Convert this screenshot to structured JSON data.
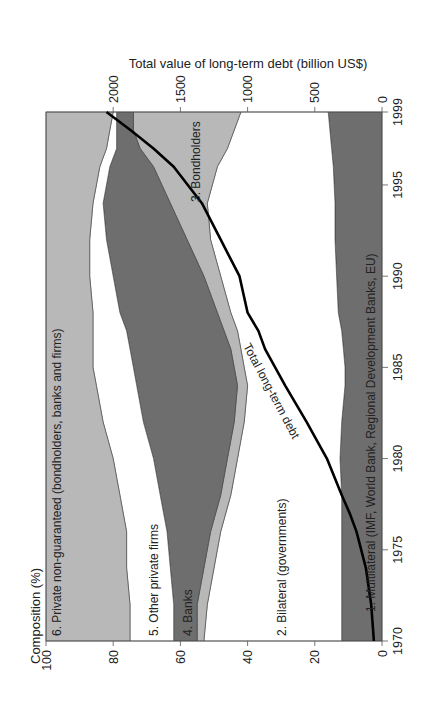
{
  "chart_data": {
    "type": "area",
    "orientation": "rotated-90 (years along vertical axis, 1970 at bottom, 1999 at top; composition % along horizontal axis, 0 at right, 100 at left)",
    "title": "",
    "xlabel": "Composition (%)",
    "secondary_axis_label": "Total value of long-term debt (billion US$)",
    "years": [
      1970,
      1972,
      1974,
      1976,
      1978,
      1980,
      1982,
      1984,
      1985,
      1986,
      1987,
      1988,
      1990,
      1992,
      1994,
      1996,
      1997,
      1998,
      1999
    ],
    "composition_ticks": [
      0,
      20,
      40,
      60,
      80,
      100
    ],
    "year_ticks": [
      1970,
      1975,
      1980,
      1985,
      1990,
      1995,
      1999
    ],
    "debt_ticks": [
      0,
      500,
      1000,
      1500,
      2000
    ],
    "composition_range": [
      0,
      100
    ],
    "debt_range": [
      0,
      2500
    ],
    "cumulative_boundaries_pct": {
      "multilateral_top": [
        12,
        12,
        12,
        12,
        12,
        12.5,
        12,
        11,
        11,
        11.5,
        12,
        13,
        13.5,
        14,
        14,
        14.5,
        15,
        15.5,
        16
      ],
      "bilateral_top": [
        53,
        52,
        50,
        48,
        45,
        43,
        41,
        40,
        41,
        42,
        43,
        45,
        48,
        51,
        52,
        49,
        46,
        44,
        42
      ],
      "bondholders_top": [
        55,
        55,
        53,
        51,
        48,
        46,
        44,
        43,
        44,
        45,
        47,
        49,
        53,
        58,
        63,
        68,
        72,
        74,
        74
      ],
      "banks_top": [
        62,
        62,
        63,
        64,
        66,
        68,
        71,
        73,
        74,
        75,
        76,
        78,
        80,
        82,
        83,
        81,
        79,
        79,
        79
      ],
      "other_private_top": [
        75,
        75,
        76,
        76,
        78,
        80,
        83,
        85,
        86,
        86,
        86,
        86,
        87,
        87,
        86,
        84,
        82,
        81,
        80
      ],
      "private_nonguaranteed_top": [
        100,
        100,
        100,
        100,
        100,
        100,
        100,
        100,
        100,
        100,
        100,
        100,
        100,
        100,
        100,
        100,
        100,
        100,
        100
      ]
    },
    "series": [
      {
        "name": "1. Multilateral (IMF, World Bank, Regional Development Banks, EU)",
        "color": "#6e6e6e",
        "values": [
          12,
          12,
          12,
          12,
          12,
          12.5,
          12,
          11,
          11,
          11.5,
          12,
          13,
          13.5,
          14,
          14,
          14.5,
          15,
          15.5,
          16
        ]
      },
      {
        "name": "2. Bilateral (governments)",
        "color": "#ffffff",
        "values": [
          41,
          40,
          38,
          36,
          33,
          30.5,
          29,
          29,
          30,
          30.5,
          31,
          32,
          34.5,
          37,
          38,
          34.5,
          31,
          28.5,
          26
        ]
      },
      {
        "name": "3. Bondholders",
        "color": "#b8b8b8",
        "values": [
          2,
          3,
          3,
          3,
          3,
          3,
          3,
          3,
          3,
          3,
          4,
          4,
          5,
          7,
          11,
          19,
          26,
          30,
          32
        ]
      },
      {
        "name": "4. Banks",
        "color": "#6e6e6e",
        "values": [
          7,
          7,
          10,
          13,
          18,
          22,
          27,
          30,
          30,
          30,
          29,
          29,
          27,
          24,
          20,
          13,
          7,
          5,
          5
        ]
      },
      {
        "name": "5. Other private firms",
        "color": "#ffffff",
        "values": [
          13,
          13,
          13,
          12,
          12,
          12,
          12,
          12,
          12,
          11,
          10,
          8,
          7,
          5,
          3,
          3,
          3,
          2,
          1
        ]
      },
      {
        "name": "6. Private non-guaranteed (bondholders, banks and firms)",
        "color": "#b8b8b8",
        "values": [
          25,
          25,
          24,
          24,
          22,
          20,
          17,
          15,
          14,
          14,
          14,
          14,
          13,
          13,
          14,
          16,
          18,
          19,
          20
        ]
      }
    ],
    "line_series": {
      "name": "Total long-term debt",
      "axis": "debt (billion US$)",
      "color": "#000000",
      "years": [
        1970,
        1972,
        1974,
        1976,
        1977,
        1978,
        1980,
        1982,
        1984,
        1986,
        1987,
        1988,
        1990,
        1992,
        1994,
        1996,
        1997,
        1998,
        1999
      ],
      "values": [
        60,
        80,
        120,
        190,
        240,
        300,
        410,
        560,
        720,
        870,
        920,
        1000,
        1060,
        1200,
        1340,
        1550,
        1700,
        1870,
        2050
      ]
    },
    "annotations": [
      "1. Multilateral (IMF, World Bank, Regional Development Banks, EU)",
      "2. Bilateral (governments)",
      "3. Bondholders",
      "4. Banks",
      "5. Other private firms",
      "6. Private non-guaranteed (bondholders, banks and firms)",
      "Total long-term debt"
    ],
    "legend": "none (inline labels)",
    "grid": false
  },
  "labels": {
    "composition_axis_title": "Composition (%)",
    "debt_axis_title": "Total value of long-term debt (billion US$)",
    "line_label": "Total long-term debt",
    "band1": "1. Multilateral (IMF,  World Bank, Regional Development Banks, EU)",
    "band2": "2. Bilateral (governments)",
    "band3": "3. Bondholders",
    "band4": "4. Banks",
    "band5": "5. Other private firms",
    "band6": "6. Private non-guaranteed (bondholders, banks and firms)"
  },
  "colors": {
    "dark": "#6e6e6e",
    "light": "#b8b8b8",
    "white": "#ffffff",
    "line": "#000000",
    "axis": "#555555"
  }
}
